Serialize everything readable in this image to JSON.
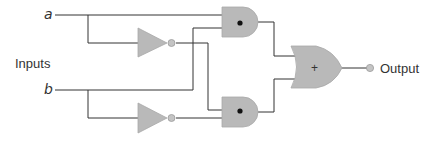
{
  "diagram": {
    "type": "logic-circuit",
    "labels": {
      "input_a": "a",
      "input_b": "b",
      "inputs": "Inputs",
      "output": "Output"
    },
    "gates": [
      {
        "id": "not1",
        "type": "NOT",
        "input": "a"
      },
      {
        "id": "not2",
        "type": "NOT",
        "input": "b"
      },
      {
        "id": "and1",
        "type": "AND",
        "symbol": "•",
        "inputs": [
          "a",
          "b"
        ]
      },
      {
        "id": "and2",
        "type": "AND",
        "symbol": "•",
        "inputs": [
          "not a",
          "not b"
        ]
      },
      {
        "id": "or1",
        "type": "OR",
        "symbol": "+",
        "inputs": [
          "and1",
          "and2"
        ]
      }
    ],
    "symbols": {
      "and": "•",
      "or": "+"
    },
    "colors": {
      "gate_fill": "#b9b9b9",
      "wire": "#333333",
      "background": "#ffffff"
    }
  }
}
